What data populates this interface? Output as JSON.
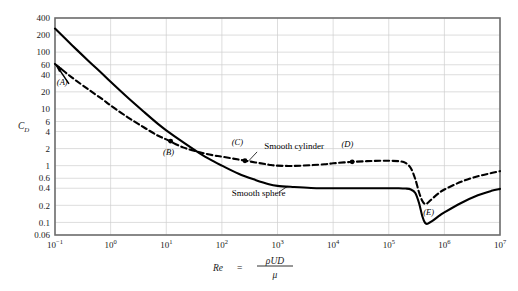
{
  "chart_data": {
    "type": "line",
    "title": "",
    "xlabel": "Re = ρUD/μ",
    "ylabel": "C_D",
    "xscale": "log",
    "yscale": "log",
    "xlim": [
      0.1,
      10000000
    ],
    "ylim": [
      0.06,
      400
    ],
    "grid": true,
    "legend_position": "inline-annotations",
    "xticks": [
      {
        "value": 0.1,
        "label": "10",
        "exponent": "−1"
      },
      {
        "value": 1,
        "label": "10",
        "exponent": "0"
      },
      {
        "value": 10,
        "label": "10",
        "exponent": "1"
      },
      {
        "value": 100,
        "label": "10",
        "exponent": "2"
      },
      {
        "value": 1000,
        "label": "10",
        "exponent": "3"
      },
      {
        "value": 10000,
        "label": "10",
        "exponent": "4"
      },
      {
        "value": 100000,
        "label": "10",
        "exponent": "5"
      },
      {
        "value": 1000000,
        "label": "10",
        "exponent": "6"
      },
      {
        "value": 10000000,
        "label": "10",
        "exponent": "7"
      }
    ],
    "yticks": [
      {
        "value": 400,
        "label": "400"
      },
      {
        "value": 200,
        "label": "200"
      },
      {
        "value": 100,
        "label": "100"
      },
      {
        "value": 60,
        "label": "60"
      },
      {
        "value": 40,
        "label": "40"
      },
      {
        "value": 20,
        "label": "20"
      },
      {
        "value": 10,
        "label": "10"
      },
      {
        "value": 6,
        "label": "6"
      },
      {
        "value": 4,
        "label": "4"
      },
      {
        "value": 2,
        "label": "2"
      },
      {
        "value": 1,
        "label": "1"
      },
      {
        "value": 0.6,
        "label": "0.6"
      },
      {
        "value": 0.4,
        "label": "0.4"
      },
      {
        "value": 0.2,
        "label": "0.2"
      },
      {
        "value": 0.1,
        "label": "0.1"
      },
      {
        "value": 0.06,
        "label": "0.06"
      }
    ],
    "series": [
      {
        "name": "Smooth cylinder",
        "style": "dashed",
        "color": "#000000",
        "points": [
          [
            0.1,
            62
          ],
          [
            0.2,
            36
          ],
          [
            0.4,
            22
          ],
          [
            0.7,
            15
          ],
          [
            1,
            11.5
          ],
          [
            2,
            7.2
          ],
          [
            4,
            4.7
          ],
          [
            7,
            3.4
          ],
          [
            10,
            2.9
          ],
          [
            20,
            2.1
          ],
          [
            40,
            1.72
          ],
          [
            70,
            1.52
          ],
          [
            100,
            1.44
          ],
          [
            200,
            1.28
          ],
          [
            400,
            1.14
          ],
          [
            700,
            1.04
          ],
          [
            1000,
            1.0
          ],
          [
            2000,
            0.99
          ],
          [
            4000,
            1.02
          ],
          [
            7000,
            1.06
          ],
          [
            10000,
            1.1
          ],
          [
            20000,
            1.16
          ],
          [
            40000,
            1.2
          ],
          [
            70000,
            1.22
          ],
          [
            100000,
            1.22
          ],
          [
            150000,
            1.2
          ],
          [
            200000,
            1.12
          ],
          [
            250000,
            0.9
          ],
          [
            300000,
            0.58
          ],
          [
            350000,
            0.34
          ],
          [
            400000,
            0.24
          ],
          [
            450000,
            0.21
          ],
          [
            500000,
            0.22
          ],
          [
            600000,
            0.26
          ],
          [
            800000,
            0.33
          ],
          [
            1000000,
            0.38
          ],
          [
            2000000,
            0.52
          ],
          [
            4000000,
            0.65
          ],
          [
            7000000,
            0.74
          ],
          [
            10000000,
            0.8
          ]
        ]
      },
      {
        "name": "Smooth sphere",
        "style": "solid",
        "color": "#000000",
        "points": [
          [
            0.1,
            260
          ],
          [
            0.2,
            134
          ],
          [
            0.4,
            70
          ],
          [
            0.7,
            42
          ],
          [
            1,
            30
          ],
          [
            2,
            16
          ],
          [
            4,
            8.8
          ],
          [
            7,
            5.5
          ],
          [
            10,
            4.2
          ],
          [
            20,
            2.6
          ],
          [
            40,
            1.65
          ],
          [
            70,
            1.2
          ],
          [
            100,
            1.0
          ],
          [
            200,
            0.72
          ],
          [
            400,
            0.56
          ],
          [
            700,
            0.47
          ],
          [
            1000,
            0.44
          ],
          [
            2000,
            0.42
          ],
          [
            4000,
            0.405
          ],
          [
            7000,
            0.4
          ],
          [
            10000,
            0.4
          ],
          [
            20000,
            0.4
          ],
          [
            40000,
            0.4
          ],
          [
            70000,
            0.4
          ],
          [
            100000,
            0.4
          ],
          [
            150000,
            0.4
          ],
          [
            200000,
            0.395
          ],
          [
            250000,
            0.38
          ],
          [
            300000,
            0.33
          ],
          [
            350000,
            0.22
          ],
          [
            400000,
            0.13
          ],
          [
            450000,
            0.098
          ],
          [
            500000,
            0.095
          ],
          [
            600000,
            0.105
          ],
          [
            800000,
            0.13
          ],
          [
            1000000,
            0.15
          ],
          [
            2000000,
            0.22
          ],
          [
            4000000,
            0.3
          ],
          [
            7000000,
            0.36
          ],
          [
            10000000,
            0.39
          ]
        ]
      }
    ],
    "annotations": [
      {
        "name": "point-a",
        "label": "(A)",
        "x": 0.1,
        "y": 62,
        "series": "Smooth cylinder",
        "marker": "arrow",
        "label_x": 0.135,
        "label_y": 26
      },
      {
        "name": "point-b",
        "label": "(B)",
        "x": 12,
        "y": 2.7,
        "series": "Smooth cylinder",
        "marker": "dot",
        "label_x": 11,
        "label_y": 1.55
      },
      {
        "name": "point-c",
        "label": "(C)",
        "x": 260,
        "y": 1.22,
        "series": "Smooth cylinder",
        "marker": "dot",
        "label_x": 190,
        "label_y": 2.3
      },
      {
        "name": "point-d",
        "label": "(D)",
        "x": 22000,
        "y": 1.17,
        "series": "Smooth cylinder",
        "marker": "dot",
        "label_x": 18000,
        "label_y": 2.1
      },
      {
        "name": "point-e",
        "label": "(E)",
        "x": 460000,
        "y": 0.21,
        "series": "Smooth cylinder",
        "marker": "none",
        "label_x": 520000,
        "label_y": 0.135
      }
    ],
    "curve_labels": [
      {
        "name": "smooth-cylinder-label",
        "text": "Smooth cylinder",
        "text_x": 580,
        "text_y": 1.95,
        "leader_from_x": 430,
        "leader_from_y": 1.75,
        "leader_to_x": 300,
        "leader_to_y": 1.2
      },
      {
        "name": "smooth-sphere-label",
        "text": "Smooth sphere",
        "text_x": 150,
        "text_y": 0.29,
        "leader_from_x": 1050,
        "leader_from_y": 0.34,
        "leader_to_x": 1500,
        "leader_to_y": 0.43
      }
    ]
  }
}
